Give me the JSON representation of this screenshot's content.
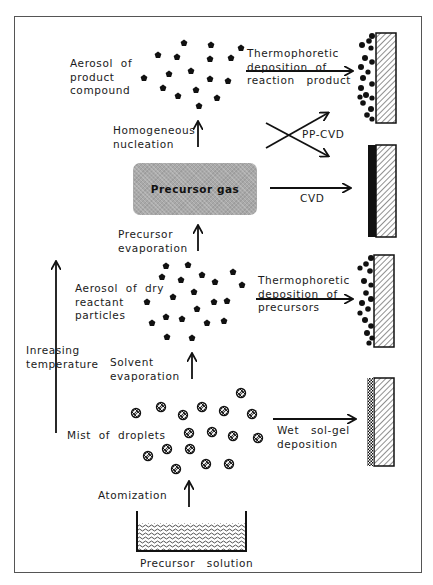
{
  "diagram": {
    "frame": true,
    "colors": {
      "ink": "#111111",
      "gas_box": "#a9a9a9",
      "frame": "#555555",
      "substrate_hatch": "#222222"
    },
    "nodes": {
      "aerosol_product": "Aerosol  of\nproduct\ncompound",
      "homogeneous_nucleation": "Homogeneous\nnucleation",
      "precursor_gas": "Precursor   gas",
      "precursor_evaporation": "Precursor\nevaporation",
      "aerosol_dry": "Aerosol  of  dry\nreactant\nparticles",
      "solvent_evaporation": "Solvent\nevaporation",
      "mist_of_droplets": "Mist  of  droplets",
      "atomization": "Atomization",
      "precursor_solution": "Precursor   solution",
      "increasing_temperature": "Inreasing\ntemperature"
    },
    "processes": {
      "thermophoretic_product": "Thermophoretic\ndeposition  of\nreaction   product",
      "pp_cvd": "PP-CVD",
      "cvd": "CVD",
      "thermophoretic_precursors": "Thermophoretic\ndeposition  of\nprecursors",
      "wet_sol_gel": "Wet   sol-gel\ndeposition"
    },
    "substrates": [
      {
        "name": "substrate-product-deposit",
        "coating": "particles"
      },
      {
        "name": "substrate-cvd-film",
        "coating": "dense-film"
      },
      {
        "name": "substrate-precursor-deposit",
        "coating": "particles"
      },
      {
        "name": "substrate-sol-gel",
        "coating": "checkered-wet-film"
      }
    ],
    "edges": [
      {
        "from": "precursor_solution",
        "to": "mist_of_droplets",
        "label": "Atomization"
      },
      {
        "from": "mist_of_droplets",
        "to": "aerosol_dry",
        "label": "Solvent evaporation"
      },
      {
        "from": "aerosol_dry",
        "to": "precursor_gas",
        "label": "Precursor evaporation"
      },
      {
        "from": "precursor_gas",
        "to": "aerosol_product",
        "label": "Homogeneous nucleation"
      },
      {
        "from": "aerosol_product",
        "to": "substrate-product-deposit",
        "label": "Thermophoretic deposition of reaction product"
      },
      {
        "from": "precursor_gas",
        "to": "substrate-cvd-film",
        "label": "CVD"
      },
      {
        "from": "crossing",
        "to": "substrate-product-deposit / substrate-cvd-film",
        "label": "PP-CVD"
      },
      {
        "from": "aerosol_dry",
        "to": "substrate-precursor-deposit",
        "label": "Thermophoretic deposition of precursors"
      },
      {
        "from": "mist_of_droplets",
        "to": "substrate-sol-gel",
        "label": "Wet sol-gel deposition"
      }
    ]
  }
}
